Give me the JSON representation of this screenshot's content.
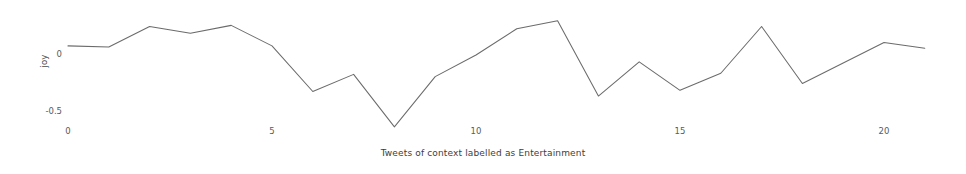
{
  "chart_data": {
    "type": "line",
    "title": "",
    "xlabel": "Tweets of context labelled as Entertainment",
    "ylabel": "joy",
    "x": [
      0,
      1,
      2,
      3,
      4,
      5,
      6,
      7,
      8,
      9,
      10,
      11,
      12,
      13,
      14,
      15,
      16,
      17,
      18,
      19,
      20,
      21
    ],
    "values": [
      0.08,
      0.07,
      0.25,
      0.19,
      0.26,
      0.08,
      -0.32,
      -0.17,
      -0.63,
      -0.19,
      0.0,
      0.23,
      0.3,
      -0.36,
      -0.06,
      -0.31,
      -0.16,
      0.25,
      -0.25,
      -0.07,
      0.11,
      0.06
    ],
    "series": [
      {
        "name": "joy",
        "values": [
          0.08,
          0.07,
          0.25,
          0.19,
          0.26,
          0.08,
          -0.32,
          -0.17,
          -0.63,
          -0.19,
          0.0,
          0.23,
          0.3,
          -0.36,
          -0.06,
          -0.31,
          -0.16,
          0.25,
          -0.25,
          -0.07,
          0.11,
          0.06
        ]
      }
    ],
    "xticks": [
      "0",
      "5",
      "10",
      "15",
      "20"
    ],
    "xtick_values": [
      0,
      5,
      10,
      15,
      20
    ],
    "yticks": [
      "0",
      "-0.5"
    ],
    "ytick_values": [
      0,
      -0.5
    ],
    "xlim": [
      -0.2,
      21.8
    ],
    "ylim": [
      -0.72,
      0.38
    ],
    "grid": false,
    "legend": false,
    "line_color": "#6b6b6b"
  }
}
